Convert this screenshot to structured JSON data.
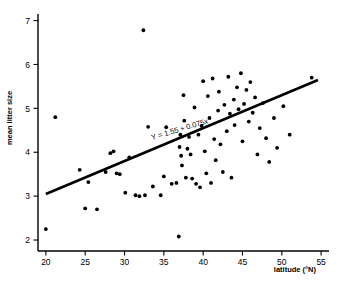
{
  "chart_data": {
    "type": "scatter",
    "title": "",
    "xlabel": "latitude (°N)",
    "ylabel": "mean litter size",
    "xlim": [
      19,
      56
    ],
    "ylim": [
      1.75,
      7.15
    ],
    "xticks": [
      20,
      25,
      30,
      35,
      40,
      45,
      50,
      55
    ],
    "yticks": [
      2,
      3,
      4,
      5,
      6,
      7
    ],
    "grid": false,
    "legend": null,
    "annotations": [
      {
        "text": "Y = 1.55 + 0.075x",
        "x": 33.5,
        "y": 4.28,
        "rotation": -16.5,
        "name": "regression-equation"
      }
    ],
    "fit": {
      "type": "linear",
      "equation": "Y = 1.55 + 0.075x",
      "intercept": 1.55,
      "slope": 0.075,
      "x_start": 20.0,
      "x_end": 54.6
    },
    "points": [
      [
        20.0,
        2.25
      ],
      [
        21.2,
        4.8
      ],
      [
        24.3,
        3.6
      ],
      [
        25.0,
        2.72
      ],
      [
        25.4,
        3.32
      ],
      [
        26.5,
        2.7
      ],
      [
        27.6,
        3.55
      ],
      [
        28.2,
        3.98
      ],
      [
        28.6,
        4.02
      ],
      [
        29.0,
        3.52
      ],
      [
        29.4,
        3.5
      ],
      [
        30.1,
        3.08
      ],
      [
        30.6,
        3.88
      ],
      [
        31.4,
        3.02
      ],
      [
        31.9,
        3.0
      ],
      [
        32.4,
        6.78
      ],
      [
        32.6,
        3.02
      ],
      [
        33.0,
        4.58
      ],
      [
        33.6,
        3.22
      ],
      [
        34.6,
        3.02
      ],
      [
        35.0,
        3.45
      ],
      [
        35.3,
        4.57
      ],
      [
        36.0,
        3.28
      ],
      [
        36.6,
        3.3
      ],
      [
        36.9,
        2.08
      ],
      [
        37.0,
        4.12
      ],
      [
        37.1,
        4.4
      ],
      [
        37.2,
        3.92
      ],
      [
        37.3,
        3.7
      ],
      [
        37.5,
        5.3
      ],
      [
        37.6,
        4.72
      ],
      [
        37.8,
        3.42
      ],
      [
        38.0,
        4.08
      ],
      [
        38.2,
        4.35
      ],
      [
        38.4,
        3.95
      ],
      [
        38.6,
        3.4
      ],
      [
        38.9,
        5.02
      ],
      [
        39.1,
        3.28
      ],
      [
        39.4,
        4.4
      ],
      [
        39.6,
        3.2
      ],
      [
        39.8,
        4.6
      ],
      [
        40.0,
        5.62
      ],
      [
        40.2,
        4.02
      ],
      [
        40.4,
        3.52
      ],
      [
        40.6,
        5.28
      ],
      [
        40.8,
        4.78
      ],
      [
        41.0,
        3.3
      ],
      [
        41.2,
        5.68
      ],
      [
        41.4,
        4.3
      ],
      [
        41.6,
        3.82
      ],
      [
        41.9,
        4.95
      ],
      [
        42.0,
        5.38
      ],
      [
        42.2,
        4.18
      ],
      [
        42.5,
        3.55
      ],
      [
        42.7,
        5.08
      ],
      [
        43.0,
        4.48
      ],
      [
        43.2,
        5.72
      ],
      [
        43.4,
        4.88
      ],
      [
        43.6,
        3.42
      ],
      [
        43.9,
        5.2
      ],
      [
        44.0,
        4.62
      ],
      [
        44.3,
        5.48
      ],
      [
        44.5,
        4.98
      ],
      [
        44.8,
        5.8
      ],
      [
        45.0,
        4.25
      ],
      [
        45.2,
        5.1
      ],
      [
        45.5,
        5.42
      ],
      [
        45.8,
        4.7
      ],
      [
        46.0,
        5.6
      ],
      [
        46.3,
        4.9
      ],
      [
        46.6,
        5.25
      ],
      [
        46.9,
        3.95
      ],
      [
        47.2,
        4.55
      ],
      [
        47.6,
        5.12
      ],
      [
        48.0,
        4.32
      ],
      [
        48.4,
        3.78
      ],
      [
        49.0,
        4.78
      ],
      [
        49.4,
        4.1
      ],
      [
        50.2,
        5.05
      ],
      [
        51.0,
        4.4
      ],
      [
        53.8,
        5.7
      ]
    ]
  }
}
